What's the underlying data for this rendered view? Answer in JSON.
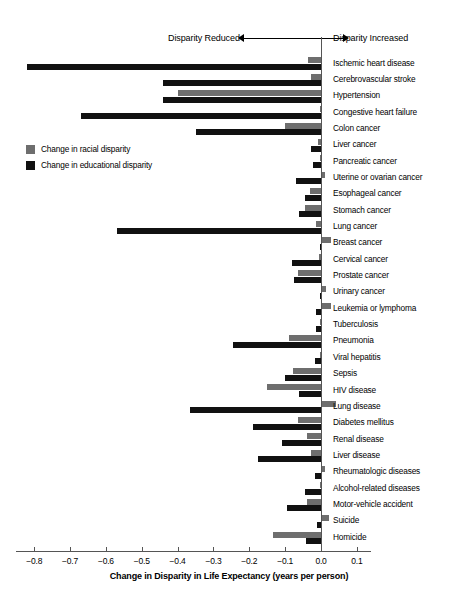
{
  "chart_data": {
    "type": "bar",
    "orientation": "horizontal",
    "title": "",
    "xlabel": "Change in Disparity in Life Expectancy (years per person)",
    "ylabel": "",
    "xlim": [
      -0.85,
      0.14
    ],
    "xticks": [
      -0.8,
      -0.7,
      -0.6,
      -0.5,
      -0.4,
      -0.3,
      -0.2,
      -0.1,
      0.0,
      0.1
    ],
    "xtick_labels": [
      "−0.8",
      "−0.7",
      "−0.6",
      "−0.5",
      "−0.4",
      "−0.3",
      "−0.2",
      "−0.1",
      "0.0",
      "0.1"
    ],
    "grid": false,
    "legend_position": "left-middle",
    "annotations": [
      {
        "text": "Disparity Reduced",
        "direction": "left"
      },
      {
        "text": "Disparity Increased",
        "direction": "right"
      }
    ],
    "categories": [
      "Ischemic heart disease",
      "Cerebrovascular stroke",
      "Hypertension",
      "Congestive heart failure",
      "Colon cancer",
      "Liver cancer",
      "Pancreatic cancer",
      "Uterine or ovarian cancer",
      "Esophageal cancer",
      "Stomach cancer",
      "Lung cancer",
      "Breast cancer",
      "Cervical cancer",
      "Prostate cancer",
      "Urinary cancer",
      "Leukemia or lymphoma",
      "Tuberculosis",
      "Pneumonia",
      "Viral hepatitis",
      "Sepsis",
      "HIV disease",
      "Lung disease",
      "Diabetes mellitus",
      "Renal disease",
      "Liver disease",
      "Rheumatologic diseases",
      "Alcohol-related diseases",
      "Motor-vehicle accident",
      "Suicide",
      "Homicide"
    ],
    "series": [
      {
        "name": "Change in racial disparity",
        "color": "#6e6e6e",
        "values": [
          -0.035,
          -0.028,
          -0.4,
          -0.004,
          -0.1,
          -0.008,
          -0.003,
          0.01,
          -0.03,
          -0.046,
          -0.014,
          0.027,
          -0.005,
          -0.065,
          0.014,
          0.028,
          -0.002,
          -0.09,
          -0.002,
          -0.078,
          -0.15,
          0.041,
          -0.065,
          -0.04,
          -0.028,
          0.011,
          -0.004,
          -0.04,
          0.022,
          -0.135
        ]
      },
      {
        "name": "Change in educational disparity",
        "color": "#111111",
        "values": [
          -0.82,
          -0.44,
          -0.44,
          -0.67,
          -0.35,
          -0.028,
          -0.022,
          -0.07,
          -0.045,
          -0.06,
          -0.57,
          -0.002,
          -0.08,
          -0.075,
          -0.003,
          -0.014,
          -0.015,
          -0.245,
          -0.018,
          -0.1,
          -0.06,
          -0.365,
          -0.19,
          -0.11,
          -0.175,
          -0.018,
          -0.045,
          -0.095,
          -0.01,
          -0.043
        ]
      }
    ]
  },
  "legend": {
    "items": [
      {
        "label": "Change in racial disparity",
        "key": "racial"
      },
      {
        "label": "Change in educational disparity",
        "key": "educational"
      }
    ]
  }
}
